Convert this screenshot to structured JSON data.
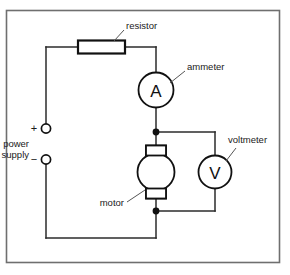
{
  "diagram": {
    "frame_color": "#6b6b6b",
    "wire_color": "#2b2b2b",
    "component_color": "#111111",
    "labels": {
      "resistor": "resistor",
      "ammeter": "ammeter",
      "voltmeter": "voltmeter",
      "motor": "motor",
      "power_supply_line1": "power",
      "power_supply_line2": "supply",
      "plus_sign": "+",
      "minus_sign": "−"
    },
    "symbols": {
      "ammeter_letter": "A",
      "voltmeter_letter": "V"
    }
  }
}
